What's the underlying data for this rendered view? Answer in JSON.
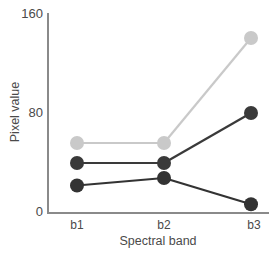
{
  "chart_data": {
    "type": "line",
    "title": "",
    "xlabel": "Spectral band",
    "ylabel": "Pixel value",
    "categories": [
      "b1",
      "b2",
      "b3"
    ],
    "x_tick_labels": [
      "b1",
      "b2",
      "b3"
    ],
    "y_tick_labels": [
      "0",
      "80",
      "160"
    ],
    "ylim": [
      0,
      160
    ],
    "yticks": [
      0,
      80,
      160
    ],
    "grid": false,
    "legend": "none",
    "series": [
      {
        "name": "series-light-gray",
        "color": "#c9c9c9",
        "marker": "circle",
        "values": [
          56,
          56,
          140
        ]
      },
      {
        "name": "series-dark-upper",
        "color": "#3a3a3a",
        "marker": "circle",
        "values": [
          40,
          40,
          80
        ]
      },
      {
        "name": "series-dark-lower",
        "color": "#333333",
        "marker": "circle",
        "values": [
          22,
          28,
          7
        ]
      }
    ]
  },
  "axes": {
    "y_labels": [
      {
        "text": "160",
        "value": 160
      },
      {
        "text": "80",
        "value": 80
      },
      {
        "text": "0",
        "value": 0
      }
    ],
    "x_labels": [
      {
        "text": "b1"
      },
      {
        "text": "b2"
      },
      {
        "text": "b3"
      }
    ],
    "x_title": "Spectral band",
    "y_title": "Pixel value",
    "axis_color": "#8a8a8a"
  }
}
